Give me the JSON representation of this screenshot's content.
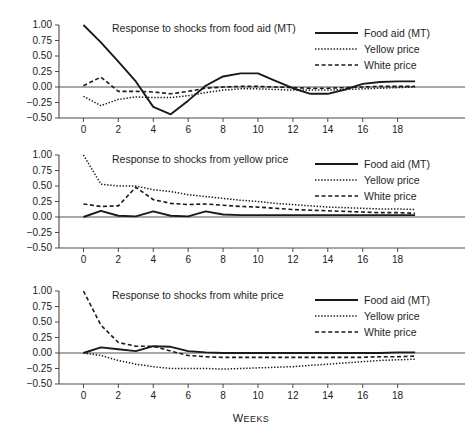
{
  "figure": {
    "xlabel": "Weeks",
    "background": "#ffffff",
    "ink": "#1a1a1a"
  },
  "legend": {
    "position": "top-right",
    "entries": [
      {
        "label": "Food aid (MT)",
        "style": "solid",
        "dash": "none",
        "width": 1.9
      },
      {
        "label": "Yellow price",
        "style": "dotted",
        "dash": "1.4,1.7",
        "width": 1.5
      },
      {
        "label": "White price",
        "style": "dashed",
        "dash": "4,2.6",
        "width": 1.6
      }
    ]
  },
  "axes": {
    "yticks": [
      "1.00",
      "0.75",
      "0.50",
      "0.25",
      "0.00",
      "-0.25",
      "-0.50"
    ],
    "ytick_values": [
      1.0,
      0.75,
      0.5,
      0.25,
      0.0,
      -0.25,
      -0.5
    ],
    "xticks": [
      "0",
      "2",
      "4",
      "6",
      "8",
      "10",
      "12",
      "14",
      "16",
      "18"
    ],
    "xtick_values": [
      0,
      2,
      4,
      6,
      8,
      10,
      12,
      14,
      16,
      18
    ],
    "ylim": [
      -0.5,
      1.0
    ],
    "xlim": [
      -1.4,
      20.6
    ],
    "grid": false
  },
  "chart_data": [
    {
      "type": "line",
      "title": "Response to shocks from food aid (MT)",
      "xlabel": "",
      "ylabel": "",
      "ylim": [
        -0.5,
        1.0
      ],
      "xlim": [
        -1.4,
        20.6
      ],
      "grid": false,
      "legend_position": "top-right",
      "x": [
        0,
        1,
        2,
        3,
        4,
        5,
        6,
        7,
        8,
        9,
        10,
        11,
        12,
        13,
        14,
        15,
        16,
        17,
        18,
        19
      ],
      "series": [
        {
          "name": "Food aid (MT)",
          "style": "solid",
          "values": [
            1.0,
            0.72,
            0.41,
            0.09,
            -0.32,
            -0.44,
            -0.22,
            0.02,
            0.17,
            0.22,
            0.22,
            0.1,
            -0.02,
            -0.11,
            -0.11,
            -0.04,
            0.05,
            0.08,
            0.09,
            0.09
          ]
        },
        {
          "name": "Yellow price",
          "style": "dotted",
          "values": [
            -0.15,
            -0.3,
            -0.2,
            -0.16,
            -0.17,
            -0.17,
            -0.14,
            -0.09,
            -0.05,
            -0.03,
            -0.03,
            -0.04,
            -0.05,
            -0.05,
            -0.05,
            -0.04,
            -0.03,
            -0.02,
            -0.01,
            0.0
          ]
        },
        {
          "name": "White price",
          "style": "dashed",
          "values": [
            0.02,
            0.16,
            -0.07,
            -0.07,
            -0.08,
            -0.11,
            -0.07,
            -0.02,
            0.0,
            0.01,
            0.01,
            0.0,
            -0.01,
            -0.02,
            -0.02,
            -0.01,
            0.0,
            0.01,
            0.01,
            0.01
          ]
        }
      ]
    },
    {
      "type": "line",
      "title": "Response to shocks from yellow price",
      "xlabel": "",
      "ylabel": "",
      "ylim": [
        -0.5,
        1.0
      ],
      "xlim": [
        -1.4,
        20.6
      ],
      "grid": false,
      "legend_position": "top-right",
      "x": [
        0,
        1,
        2,
        3,
        4,
        5,
        6,
        7,
        8,
        9,
        10,
        11,
        12,
        13,
        14,
        15,
        16,
        17,
        18,
        19
      ],
      "series": [
        {
          "name": "Food aid (MT)",
          "style": "solid",
          "values": [
            0.0,
            0.1,
            0.02,
            0.01,
            0.09,
            0.02,
            0.01,
            0.09,
            0.04,
            0.03,
            0.03,
            0.03,
            0.03,
            0.03,
            0.03,
            0.03,
            0.03,
            0.03,
            0.03,
            0.03
          ]
        },
        {
          "name": "Yellow price",
          "style": "dotted",
          "values": [
            1.0,
            0.53,
            0.5,
            0.5,
            0.44,
            0.41,
            0.36,
            0.33,
            0.3,
            0.27,
            0.25,
            0.22,
            0.2,
            0.18,
            0.16,
            0.15,
            0.14,
            0.13,
            0.13,
            0.12
          ]
        },
        {
          "name": "White price",
          "style": "dashed",
          "values": [
            0.21,
            0.17,
            0.18,
            0.48,
            0.28,
            0.22,
            0.2,
            0.21,
            0.19,
            0.17,
            0.16,
            0.14,
            0.12,
            0.11,
            0.1,
            0.09,
            0.08,
            0.07,
            0.07,
            0.06
          ]
        }
      ]
    },
    {
      "type": "line",
      "title": "Response to shocks from white price",
      "xlabel": "Weeks",
      "ylabel": "",
      "ylim": [
        -0.5,
        1.0
      ],
      "xlim": [
        -1.4,
        20.6
      ],
      "grid": false,
      "legend_position": "top-right",
      "x": [
        0,
        1,
        2,
        3,
        4,
        5,
        6,
        7,
        8,
        9,
        10,
        11,
        12,
        13,
        14,
        15,
        16,
        17,
        18,
        19
      ],
      "series": [
        {
          "name": "Food aid (MT)",
          "style": "solid",
          "values": [
            0.0,
            0.09,
            0.06,
            0.03,
            0.11,
            0.1,
            0.03,
            0.01,
            0.0,
            0.0,
            0.0,
            0.0,
            0.0,
            0.0,
            0.0,
            0.0,
            0.0,
            0.0,
            0.01,
            0.01
          ]
        },
        {
          "name": "Yellow price",
          "style": "dotted",
          "values": [
            0.0,
            -0.04,
            -0.12,
            -0.18,
            -0.22,
            -0.25,
            -0.25,
            -0.25,
            -0.26,
            -0.25,
            -0.24,
            -0.23,
            -0.22,
            -0.2,
            -0.18,
            -0.16,
            -0.14,
            -0.12,
            -0.11,
            -0.1
          ]
        },
        {
          "name": "White price",
          "style": "dashed",
          "values": [
            1.0,
            0.45,
            0.17,
            0.11,
            0.11,
            0.03,
            -0.04,
            -0.06,
            -0.07,
            -0.07,
            -0.07,
            -0.07,
            -0.07,
            -0.07,
            -0.07,
            -0.07,
            -0.07,
            -0.06,
            -0.06,
            -0.05
          ]
        }
      ]
    }
  ],
  "panel_geometry": [
    {
      "top": 12,
      "height": 130,
      "plot_left": 59,
      "plot_right": 443,
      "plot_top": 13,
      "plot_bottom": 106,
      "show_xlabels": true,
      "show_axis_title": false
    },
    {
      "top": 143,
      "height": 131,
      "plot_left": 59,
      "plot_right": 443,
      "plot_top": 12,
      "plot_bottom": 105,
      "show_xlabels": true,
      "show_axis_title": false
    },
    {
      "top": 279,
      "height": 145,
      "plot_left": 59,
      "plot_right": 443,
      "plot_top": 12,
      "plot_bottom": 105,
      "show_xlabels": true,
      "show_axis_title": true
    }
  ],
  "legend_geometry": {
    "line_x1": 315,
    "line_x2": 358,
    "text_x": 364,
    "row0_y": 21,
    "row_gap": 16
  },
  "title_position": {
    "x": 112,
    "y": 20
  }
}
